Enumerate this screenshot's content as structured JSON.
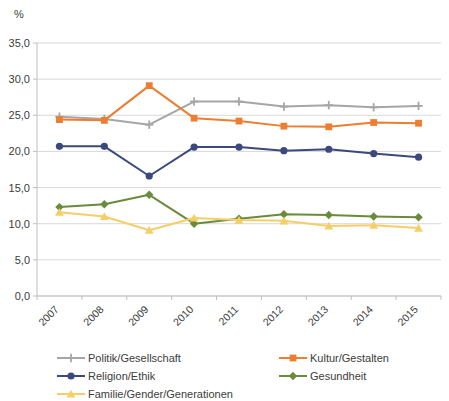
{
  "chart_data": {
    "type": "line",
    "title": "",
    "xlabel": "",
    "ylabel": "%",
    "ylim": [
      0,
      35
    ],
    "ytick_labels": [
      "0,0",
      "5,0",
      "10,0",
      "15,0",
      "20,0",
      "25,0",
      "30,0",
      "35,0"
    ],
    "ytick_values": [
      0,
      5,
      10,
      15,
      20,
      25,
      30,
      35
    ],
    "grid": true,
    "legend_position": "bottom",
    "categories": [
      "2007",
      "2008",
      "2009",
      "2010",
      "2011",
      "2012",
      "2013",
      "2014",
      "2015"
    ],
    "series": [
      {
        "name": "Politik/Gesellschaft",
        "color": "#a6a6a6",
        "marker": "plus",
        "values": [
          24.8,
          24.5,
          23.7,
          26.9,
          26.9,
          26.2,
          26.4,
          26.1,
          26.3
        ]
      },
      {
        "name": "Kultur/Gestalten",
        "color": "#ed7d31",
        "marker": "square",
        "values": [
          24.4,
          24.3,
          29.1,
          24.6,
          24.2,
          23.5,
          23.4,
          24.0,
          23.9
        ]
      },
      {
        "name": "Religion/Ethik",
        "color": "#3b4a7e",
        "marker": "circle",
        "values": [
          20.7,
          20.7,
          16.6,
          20.6,
          20.6,
          20.1,
          20.3,
          19.7,
          19.2
        ]
      },
      {
        "name": "Gesundheit",
        "color": "#6a8b3c",
        "marker": "diamond",
        "values": [
          12.3,
          12.7,
          14.0,
          10.0,
          10.7,
          11.3,
          11.2,
          11.0,
          10.9
        ]
      },
      {
        "name": "Familie/Gender/Generationen",
        "color": "#f5ce68",
        "marker": "triangle",
        "values": [
          11.6,
          11.0,
          9.1,
          10.8,
          10.5,
          10.4,
          9.7,
          9.8,
          9.4
        ]
      }
    ]
  },
  "axis": {
    "unit_label": "%"
  },
  "legend": {
    "items": [
      {
        "label": "Politik/Gesellschaft",
        "color": "#a6a6a6",
        "marker": "plus"
      },
      {
        "label": "Kultur/Gestalten",
        "color": "#ed7d31",
        "marker": "square"
      },
      {
        "label": "Religion/Ethik",
        "color": "#3b4a7e",
        "marker": "circle"
      },
      {
        "label": "Gesundheit",
        "color": "#6a8b3c",
        "marker": "diamond"
      },
      {
        "label": "Familie/Gender/Generationen",
        "color": "#f5ce68",
        "marker": "triangle"
      }
    ]
  }
}
